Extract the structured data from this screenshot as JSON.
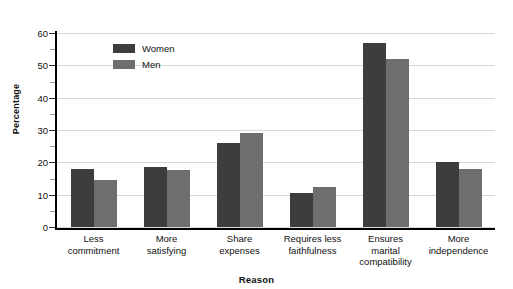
{
  "page_bleed_text": "",
  "chart_data": {
    "type": "bar",
    "title": "",
    "xlabel": "Reason",
    "ylabel": "Percentage",
    "categories": [
      "Less commitment",
      "More satisfying",
      "Share expenses",
      "Requires less faithfulness",
      "Ensures marital compatibility",
      "More independence"
    ],
    "category_lines": [
      [
        "Less",
        "commitment"
      ],
      [
        "More",
        "satisfying"
      ],
      [
        "Share",
        "expenses"
      ],
      [
        "Requires less",
        "faithfulness"
      ],
      [
        "Ensures",
        "marital",
        "compatibility"
      ],
      [
        "More",
        "independence"
      ]
    ],
    "series": [
      {
        "name": "Women",
        "color": "#3d3d3d",
        "values": [
          18,
          18.5,
          26,
          10.5,
          57,
          20
        ]
      },
      {
        "name": "Men",
        "color": "#6e6e6e",
        "values": [
          14.5,
          17.5,
          29,
          12.5,
          52,
          18
        ]
      }
    ],
    "ylim": [
      0,
      60
    ],
    "ytick_labels": [
      "0",
      "10",
      "20",
      "30",
      "40",
      "50",
      "60"
    ],
    "ytick_values": [
      0,
      10,
      20,
      30,
      40,
      50,
      60
    ],
    "yminor_values": [
      5,
      15,
      25,
      35,
      45,
      55
    ],
    "grid": "horizontal",
    "legend_position": "top-left-inside"
  }
}
